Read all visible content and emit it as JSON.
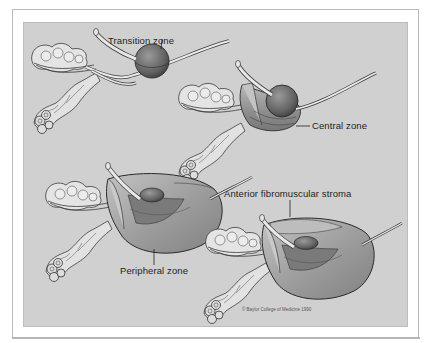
{
  "figure": {
    "background_color": "#d0d0d0",
    "frame_color": "#b9b9b9",
    "labels": {
      "transition_zone": "Transition zone",
      "central_zone": "Central zone",
      "peripheral_zone": "Peripheral zone",
      "anterior_fibromuscular_stroma": "Anterior fibromuscular stroma"
    },
    "copyright": "© Baylor College of Medicine 1990",
    "panels": [
      {
        "position": "top-left",
        "highlight": "transition_zone"
      },
      {
        "position": "top-right",
        "highlight": "central_zone"
      },
      {
        "position": "bottom-left",
        "highlight": "peripheral_zone"
      },
      {
        "position": "bottom-right",
        "highlight": "anterior_fibromuscular_stroma"
      }
    ]
  }
}
